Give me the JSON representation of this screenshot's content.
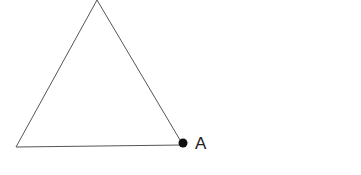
{
  "diagram": {
    "shape": "triangle",
    "vertices": [
      [
        97,
        0
      ],
      [
        16,
        147
      ],
      [
        183,
        145
      ]
    ],
    "stroke_color": "#555555",
    "point": {
      "label": "A",
      "x": 183,
      "y": 143,
      "color": "#111111"
    }
  }
}
